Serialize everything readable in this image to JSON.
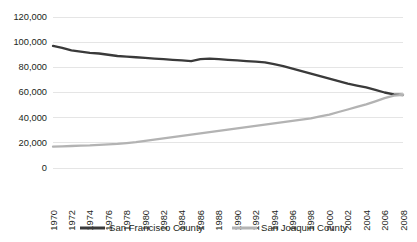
{
  "chart_data": {
    "type": "line",
    "title": "",
    "subtitle": "",
    "xlabel": "",
    "ylabel": "",
    "grid": true,
    "legend_position": "bottom",
    "ylim": [
      0,
      120000
    ],
    "yticks": [
      0,
      20000,
      40000,
      60000,
      80000,
      100000,
      120000
    ],
    "ytick_labels": [
      "0",
      "20,000",
      "40,000",
      "60,000",
      "80,000",
      "100,000",
      "120,000"
    ],
    "xlim": [
      1970,
      2008
    ],
    "x": [
      1970,
      1971,
      1972,
      1973,
      1974,
      1975,
      1976,
      1977,
      1978,
      1979,
      1980,
      1981,
      1982,
      1983,
      1984,
      1985,
      1986,
      1987,
      1988,
      1989,
      1990,
      1991,
      1992,
      1993,
      1994,
      1995,
      1996,
      1997,
      1998,
      1999,
      2000,
      2001,
      2002,
      2003,
      2004,
      2005,
      2006,
      2007,
      2008
    ],
    "xticks": [
      1970,
      1972,
      1974,
      1976,
      1978,
      1980,
      1982,
      1984,
      1986,
      1988,
      1990,
      1992,
      1994,
      1996,
      1998,
      2000,
      2002,
      2004,
      2006,
      2008
    ],
    "xtick_labels": [
      "1970",
      "1972",
      "1974",
      "1976",
      "1978",
      "1980",
      "1982",
      "1984",
      "1986",
      "1988",
      "1990",
      "1992",
      "1994",
      "1996",
      "1998",
      "2000",
      "2002",
      "2004",
      "2006",
      "2008"
    ],
    "series": [
      {
        "name": "San Francisco County",
        "color": "#3a3a3a",
        "width": 2.3,
        "values": [
          97000,
          95500,
          93500,
          92500,
          91500,
          91000,
          90000,
          89000,
          88500,
          88000,
          87500,
          87000,
          86500,
          86000,
          85500,
          85000,
          86500,
          87000,
          86500,
          86000,
          85500,
          85000,
          84500,
          84000,
          82500,
          81000,
          79000,
          77000,
          75000,
          73000,
          71000,
          69000,
          67000,
          65500,
          64000,
          62000,
          60000,
          58500,
          58000
        ]
      },
      {
        "name": "San Joaquin County",
        "color": "#b3b3b3",
        "width": 2.3,
        "values": [
          17000,
          17200,
          17500,
          17800,
          18000,
          18400,
          18800,
          19200,
          19800,
          20500,
          21500,
          22500,
          23500,
          24500,
          25500,
          26500,
          27500,
          28500,
          29500,
          30500,
          31500,
          32500,
          33500,
          34500,
          35500,
          36500,
          37500,
          38500,
          39500,
          41000,
          42500,
          44500,
          46500,
          48500,
          50500,
          53000,
          55500,
          57500,
          58200
        ]
      }
    ]
  },
  "legend": {
    "items": [
      {
        "label": "San Francisco County",
        "color": "#3a3a3a"
      },
      {
        "label": "San Joaquin County",
        "color": "#b3b3b3"
      }
    ]
  }
}
